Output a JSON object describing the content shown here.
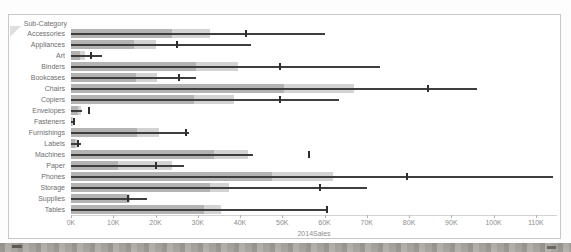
{
  "chart_data": {
    "type": "bar",
    "subtype": "bullet-bar-with-whiskers",
    "title": "",
    "ylabel": "Sub-Category",
    "xlabel": "2014Sales",
    "legend": "none",
    "grid": "off",
    "x_axis": {
      "ticks": [
        "0K",
        "10K",
        "20K",
        "30K",
        "40K",
        "50K",
        "60K",
        "70K",
        "80K",
        "90K",
        "100K",
        "110K"
      ],
      "tick_values_k": [
        0,
        10,
        20,
        30,
        40,
        50,
        60,
        70,
        80,
        90,
        100,
        110
      ],
      "plot_max_k": 115
    },
    "categories": [
      "Accessories",
      "Appliances",
      "Art",
      "Binders",
      "Bookcases",
      "Chairs",
      "Copiers",
      "Envelopes",
      "Fasteners",
      "Furnishings",
      "Labels",
      "Machines",
      "Paper",
      "Phones",
      "Storage",
      "Supplies",
      "Tables"
    ],
    "series": [
      {
        "name": "light-band-k",
        "role": "background-band-80pct",
        "values": [
          33,
          20,
          3.3,
          39.5,
          20.4,
          67,
          38.5,
          2.3,
          0.5,
          20.8,
          1.5,
          42,
          24,
          62,
          37.5,
          14,
          35.5
        ]
      },
      {
        "name": "dark-band-k",
        "role": "background-band-60pct",
        "values": [
          24,
          15,
          2.2,
          29.5,
          15.3,
          50.5,
          29,
          1.6,
          0.3,
          15.6,
          1.0,
          33.8,
          11.2,
          47.5,
          33,
          13.3,
          31.5
        ]
      },
      {
        "name": "whisker-end-k",
        "role": "whisker-line-from-zero",
        "values": [
          60,
          42.5,
          7.4,
          73,
          29.5,
          96,
          63.5,
          2.6,
          0.9,
          28,
          2.3,
          43,
          26.7,
          114,
          70,
          17.9,
          60.5
        ]
      },
      {
        "name": "reference-tick-k",
        "role": "reference-mark",
        "values": [
          41.5,
          25,
          4.7,
          49.5,
          25.5,
          84.5,
          49.5,
          4.2,
          0.7,
          27.3,
          1.7,
          56.3,
          20.2,
          79.5,
          59,
          13.5,
          60.5
        ]
      }
    ],
    "colors": {
      "band_light": "#d3d3d3",
      "band_dark": "#b3b3b3",
      "whisker": "#3e3e3e",
      "reference_tick": "#2e2e2e",
      "row_label": "#6e6e6e",
      "axis_label": "#8d8d8d",
      "panel_border": "#c8c8c8"
    }
  }
}
